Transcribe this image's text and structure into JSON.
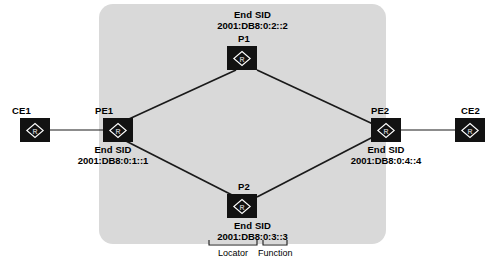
{
  "diagram": {
    "type": "srv6-network-topology",
    "core_panel": {
      "label": ""
    },
    "nodes": [
      {
        "id": "ce1",
        "name": "CE1",
        "icon": "router-icon",
        "glyph": "R",
        "sid_title": null,
        "sid_value": null
      },
      {
        "id": "pe1",
        "name": "PE1",
        "icon": "router-icon",
        "glyph": "R",
        "sid_title": "End SID",
        "sid_value": "2001:DB8:0:1::1"
      },
      {
        "id": "p1",
        "name": "P1",
        "icon": "router-icon",
        "glyph": "R",
        "sid_title": "End SID",
        "sid_value": "2001:DB8:0:2::2"
      },
      {
        "id": "p2",
        "name": "P2",
        "icon": "router-icon",
        "glyph": "R",
        "sid_title": "End SID",
        "sid_value": "2001:DB8:0:3::3"
      },
      {
        "id": "pe2",
        "name": "PE2",
        "icon": "router-icon",
        "glyph": "R",
        "sid_title": "End SID",
        "sid_value": "2001:DB8:0:4::4"
      },
      {
        "id": "ce2",
        "name": "CE2",
        "icon": "router-icon",
        "glyph": "R",
        "sid_title": null,
        "sid_value": null
      }
    ],
    "links": [
      {
        "from": "ce1",
        "to": "pe1"
      },
      {
        "from": "pe1",
        "to": "p1"
      },
      {
        "from": "p1",
        "to": "pe2"
      },
      {
        "from": "pe1",
        "to": "p2"
      },
      {
        "from": "p2",
        "to": "pe2"
      },
      {
        "from": "pe2",
        "to": "ce2"
      }
    ],
    "annotations": {
      "locator_label": "Locator",
      "function_label": "Function"
    },
    "colors": {
      "panel": "#d9d9d9",
      "node": "#121212",
      "link": "#1a1a1a",
      "text": "#000000",
      "background": "#ffffff"
    }
  }
}
